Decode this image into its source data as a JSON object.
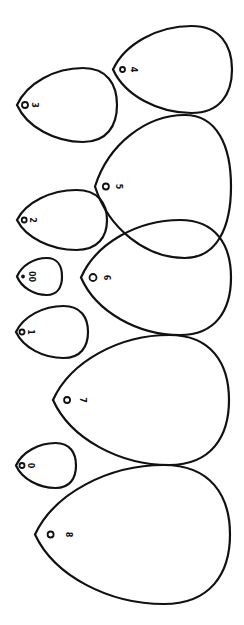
{
  "diagram": {
    "title": "",
    "background": "#ffffff",
    "stroke_color": "#111111",
    "orientation": "rotated 90deg clockwise",
    "shapes": [
      {
        "label": "4",
        "tip_x": 113,
        "right_x": 232,
        "top_y": 26,
        "bottom_y": 113,
        "hole_r": 2.5
      },
      {
        "label": "3",
        "tip_x": 17,
        "right_x": 117,
        "top_y": 68,
        "bottom_y": 142,
        "hole_r": 3
      },
      {
        "label": "5",
        "tip_x": 95,
        "right_x": 231,
        "top_y": 115,
        "bottom_y": 258,
        "hole_r": 3
      },
      {
        "label": "2",
        "tip_x": 17,
        "right_x": 107,
        "top_y": 190,
        "bottom_y": 250,
        "hole_r": 2.5
      },
      {
        "label": "00",
        "tip_x": 17,
        "right_x": 62,
        "top_y": 258,
        "bottom_y": 295,
        "hole_r": 1
      },
      {
        "label": "6",
        "tip_x": 81,
        "right_x": 231,
        "top_y": 220,
        "bottom_y": 335,
        "hole_r": 3.5
      },
      {
        "label": "1",
        "tip_x": 16,
        "right_x": 88,
        "top_y": 306,
        "bottom_y": 358,
        "hole_r": 2.5
      },
      {
        "label": "7",
        "tip_x": 53,
        "right_x": 229,
        "top_y": 335,
        "bottom_y": 465,
        "hole_r": 3
      },
      {
        "label": "0",
        "tip_x": 16,
        "right_x": 76,
        "top_y": 443,
        "bottom_y": 488,
        "hole_r": 2.5
      },
      {
        "label": "8",
        "tip_x": 35,
        "right_x": 230,
        "top_y": 465,
        "bottom_y": 604,
        "hole_r": 3
      }
    ]
  }
}
